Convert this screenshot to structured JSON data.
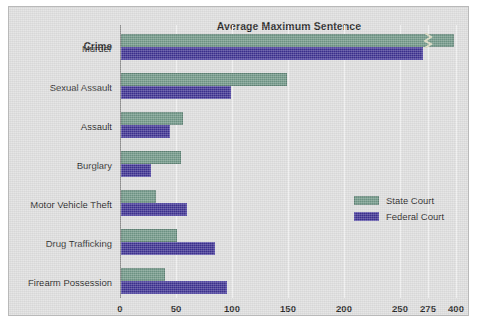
{
  "chart_data": {
    "type": "bar",
    "orientation": "horizontal",
    "title": "Average Maximum Sentence",
    "subtitle": "(in Months)",
    "ylabel": "Crime",
    "xlabel": "",
    "grid": true,
    "legend_position": "right-middle",
    "xticks": [
      {
        "label": "0",
        "value": 0,
        "px": 0
      },
      {
        "label": "50",
        "value": 50,
        "px": 56
      },
      {
        "label": "100",
        "value": 100,
        "px": 112
      },
      {
        "label": "150",
        "value": 150,
        "px": 168
      },
      {
        "label": "200",
        "value": 200,
        "px": 224
      },
      {
        "label": "250",
        "value": 250,
        "px": 280
      },
      {
        "label": "275",
        "value": 275,
        "px": 308
      },
      {
        "label": "400",
        "value": 400,
        "px": 336
      }
    ],
    "axis_break": {
      "after_tick": "275",
      "note": "axis compressed between 275 and 400"
    },
    "categories": [
      "Murder",
      "Sexual Assault",
      "Assault",
      "Burglary",
      "Motor Vehicle Theft",
      "Drug Trafficking",
      "Firearm Possession"
    ],
    "series": [
      {
        "name": "State Court",
        "color": "#6e9585",
        "values": [
          385,
          148,
          55,
          54,
          31,
          50,
          39
        ]
      },
      {
        "name": "Federal Court",
        "color": "#3b2f8f",
        "values": [
          270,
          98,
          44,
          27,
          59,
          84,
          95
        ]
      }
    ]
  },
  "legend": {
    "items": [
      {
        "label": "State Court",
        "color": "#6e9585"
      },
      {
        "label": "Federal Court",
        "color": "#3b2f8f"
      }
    ]
  },
  "colors": {
    "state_court": "#6e9585",
    "federal_court": "#3b2f8f",
    "plot_background": "#dcdcdc",
    "gridline": "#f2f2f2",
    "axis": "#8f8f8f"
  }
}
